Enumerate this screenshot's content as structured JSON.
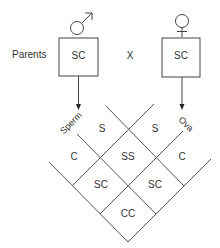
{
  "diagram": {
    "type": "punnett-square-diamond",
    "parents_label": "Parents",
    "cross_symbol": "X",
    "male": {
      "symbol": "male-symbol",
      "genotype": "SC"
    },
    "female": {
      "symbol": "female-symbol",
      "genotype": "SC"
    },
    "sperm_label": "Sperm",
    "ova_label": "Ova",
    "sperm_alleles": [
      "S",
      "C"
    ],
    "ova_alleles": [
      "S",
      "C"
    ],
    "offspring": {
      "ss": "SS",
      "sc_left": "SC",
      "sc_right": "SC",
      "cc": "CC"
    },
    "colors": {
      "line": "#444444",
      "text": "#333333",
      "background": "#ffffff"
    }
  }
}
